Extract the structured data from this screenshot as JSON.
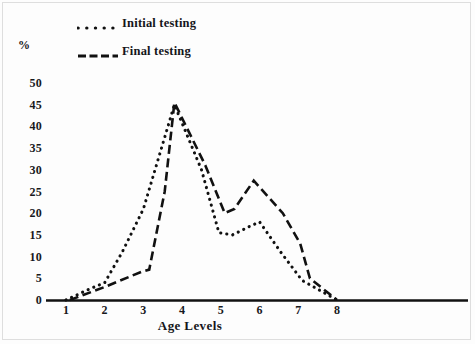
{
  "chart_data": {
    "type": "line",
    "title": "",
    "xlabel": "Age Levels",
    "ylabel": "%",
    "x": [
      1,
      2,
      3,
      4,
      5,
      6,
      7,
      8
    ],
    "categories": [
      "1",
      "2",
      "3",
      "4",
      "5",
      "6",
      "7",
      "8"
    ],
    "xlim": [
      1,
      8
    ],
    "ylim": [
      0,
      50
    ],
    "yticks": [
      0,
      5,
      10,
      15,
      20,
      25,
      30,
      35,
      40,
      45,
      50
    ],
    "ytick_labels": [
      "0",
      "5",
      "10",
      "15",
      "20",
      "25",
      "30",
      "35",
      "40",
      "45",
      "50"
    ],
    "xtick_labels": [
      "1",
      "2",
      "3",
      "4",
      "5",
      "6",
      "7",
      "8"
    ],
    "grid": false,
    "legend_position": "top-left",
    "series": [
      {
        "name": "Initial testing",
        "style": "dotted",
        "color": "#111111",
        "values": [
          0,
          4,
          21,
          45,
          15,
          18,
          4.5,
          0
        ],
        "points": [
          {
            "x": 1.0,
            "y": 0
          },
          {
            "x": 1.6,
            "y": 2.5
          },
          {
            "x": 2.0,
            "y": 4
          },
          {
            "x": 2.45,
            "y": 11
          },
          {
            "x": 3.0,
            "y": 21
          },
          {
            "x": 3.8,
            "y": 45
          },
          {
            "x": 4.5,
            "y": 30
          },
          {
            "x": 4.95,
            "y": 15.5
          },
          {
            "x": 5.3,
            "y": 15
          },
          {
            "x": 5.75,
            "y": 17
          },
          {
            "x": 6.0,
            "y": 18
          },
          {
            "x": 6.55,
            "y": 11
          },
          {
            "x": 7.1,
            "y": 4.5
          },
          {
            "x": 7.5,
            "y": 2.5
          },
          {
            "x": 8.0,
            "y": 0
          }
        ]
      },
      {
        "name": "Final testing",
        "style": "dashed",
        "color": "#111111",
        "values": [
          0,
          3,
          6.5,
          45.5,
          20,
          27.5,
          5.5,
          0
        ],
        "points": [
          {
            "x": 1.1,
            "y": 0
          },
          {
            "x": 2.0,
            "y": 3
          },
          {
            "x": 2.95,
            "y": 6.5
          },
          {
            "x": 3.15,
            "y": 7
          },
          {
            "x": 3.55,
            "y": 25
          },
          {
            "x": 3.8,
            "y": 45.5
          },
          {
            "x": 4.6,
            "y": 31
          },
          {
            "x": 5.1,
            "y": 20
          },
          {
            "x": 5.35,
            "y": 21
          },
          {
            "x": 5.85,
            "y": 27.5
          },
          {
            "x": 6.6,
            "y": 20
          },
          {
            "x": 7.05,
            "y": 13
          },
          {
            "x": 7.3,
            "y": 5
          },
          {
            "x": 8.0,
            "y": 0
          }
        ]
      }
    ]
  },
  "legend": {
    "initial": {
      "label": "Initial testing",
      "style": "dotted"
    },
    "final": {
      "label": "Final testing",
      "style": "dashed"
    }
  },
  "axes": {
    "y_title": "%",
    "x_title": "Age Levels"
  }
}
